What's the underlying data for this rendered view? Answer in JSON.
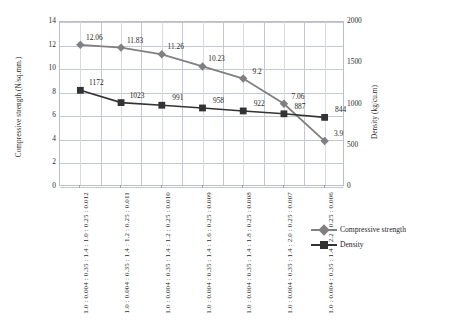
{
  "chart_data": {
    "type": "line",
    "title": "",
    "categories": [
      "1.0 : 0.004 : 0.35 : 1.4 : 1.0 : 0.25 : 0.012",
      "1.0 : 0.004 : 0.35 : 1.4 : 1.2 : 0.25 : 0.011",
      "1.0 : 0.004 : 0.35 : 1.4 : 1.2 : 0.25 : 0.010",
      "1.0 : 0.004 : 0.35 : 1.4 : 1.6 : 0.25 : 0.009",
      "1.0 : 0.004 : 0.35 : 1.4 : 1.8 : 0.25 : 0.008",
      "1.0 : 0.004 : 0.35 : 1.4 : 2.0 : 0.25 : 0.007",
      "1.0 : 0.004 : 0.35 : 1.4 : 2.2 : 0.25 : 0.006"
    ],
    "series": [
      {
        "name": "Compressive strength",
        "axis": "left",
        "marker": "diamond",
        "color": "#808080",
        "values": [
          12.06,
          11.83,
          11.26,
          10.23,
          9.2,
          7.06,
          3.9
        ],
        "labels": [
          "12.06",
          "11.83",
          "11.26",
          "10.23",
          "9.2",
          "7.06",
          "3.9"
        ]
      },
      {
        "name": "Density",
        "axis": "right",
        "marker": "square",
        "color": "#333333",
        "values": [
          1172,
          1023,
          991,
          958,
          922,
          887,
          844
        ],
        "labels": [
          "1172",
          "1023",
          "991",
          "958",
          "922",
          "887",
          "844"
        ]
      }
    ],
    "xlabel": "",
    "ylabel_left": "Compressive strength (N/sq.mm.)",
    "ylabel_right": "Density (kg/cu.m)",
    "ylim_left": [
      0,
      14
    ],
    "ylim_right": [
      0,
      2000
    ],
    "yticks_left": [
      "0",
      "2",
      "4",
      "6",
      "8",
      "10",
      "12",
      "14"
    ],
    "yticks_right": [
      "0",
      "500",
      "1000",
      "1500",
      "2000"
    ],
    "grid": "horizontal-and-vertical",
    "legend_position": "right",
    "legend": [
      "Compressive strength",
      "Density"
    ]
  },
  "axes": {
    "left_title": "Compressive strength (N/sq.mm.)",
    "right_title": "Density (kg/cu.m)"
  },
  "legend": {
    "items": [
      {
        "label": "Compressive strength",
        "color": "#808080"
      },
      {
        "label": "Density",
        "color": "#333333"
      }
    ]
  }
}
